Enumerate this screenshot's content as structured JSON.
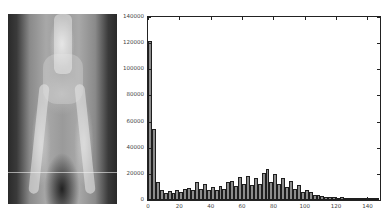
{
  "figure": {
    "left_panel": {
      "type": "image",
      "subject": "pelvis-hindlimb-xray"
    }
  },
  "chart_data": {
    "type": "bar",
    "title": "",
    "xlabel": "",
    "ylabel": "",
    "xlim": [
      0,
      148
    ],
    "ylim": [
      0,
      140000
    ],
    "grid": false,
    "legend": null,
    "bin_width": 2.5,
    "x_ticks": [
      "0",
      "20",
      "40",
      "60",
      "80",
      "100",
      "120",
      "140"
    ],
    "y_ticks": [
      "0",
      "20000",
      "40000",
      "60000",
      "80000",
      "100000",
      "120000",
      "140000"
    ],
    "x": [
      1.25,
      3.75,
      6.25,
      8.75,
      11.25,
      13.75,
      16.25,
      18.75,
      21.25,
      23.75,
      26.25,
      28.75,
      31.25,
      33.75,
      36.25,
      38.75,
      41.25,
      43.75,
      46.25,
      48.75,
      51.25,
      53.75,
      56.25,
      58.75,
      61.25,
      63.75,
      66.25,
      68.75,
      71.25,
      73.75,
      76.25,
      78.75,
      81.25,
      83.75,
      86.25,
      88.75,
      91.25,
      93.75,
      96.25,
      98.75,
      101.25,
      103.75,
      106.25,
      108.75,
      111.25,
      113.75,
      116.25,
      118.75,
      121.25,
      123.75,
      126.25,
      128.75,
      131.25,
      133.75,
      136.25,
      138.75,
      141.25,
      143.75,
      146.25
    ],
    "values": [
      122000,
      54000,
      13500,
      8000,
      5000,
      7000,
      5000,
      8000,
      6500,
      8500,
      9000,
      7500,
      14000,
      8500,
      12500,
      8000,
      10000,
      7500,
      11000,
      8500,
      14000,
      14500,
      10500,
      17500,
      12500,
      18500,
      11500,
      17000,
      12000,
      21000,
      24000,
      14000,
      20000,
      12500,
      17000,
      10000,
      14500,
      8500,
      11500,
      6500,
      8000,
      6500,
      4000,
      4000,
      3000,
      2500,
      2000,
      2500,
      1500,
      2000,
      1000,
      500,
      500,
      300,
      200,
      200,
      100,
      100,
      100
    ]
  }
}
